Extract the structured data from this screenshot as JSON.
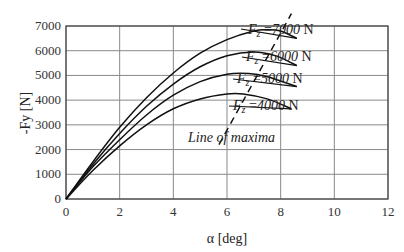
{
  "chart_data": {
    "type": "line",
    "title": "",
    "xlabel": "α [deg]",
    "ylabel": "-Fy [N]",
    "xlim": [
      0,
      12
    ],
    "ylim": [
      0,
      7000
    ],
    "xticks": [
      0,
      2,
      4,
      6,
      8,
      10,
      12
    ],
    "yticks": [
      0,
      1000,
      2000,
      3000,
      4000,
      5000,
      6000,
      7000
    ],
    "grid": true,
    "series": [
      {
        "name": "Fz =7000 N",
        "label_prefix": "F",
        "label_sub": "z",
        "label_value": " =7000 N",
        "x": [
          0,
          1,
          2,
          3,
          4,
          5,
          6,
          7,
          7.5,
          8,
          8.6
        ],
        "y": [
          0,
          1500,
          2900,
          4100,
          5100,
          5900,
          6450,
          6800,
          6850,
          6800,
          6500
        ]
      },
      {
        "name": "Fz =6000 N",
        "label_prefix": "F",
        "label_sub": "z",
        "label_value": " =6000 N",
        "x": [
          0,
          1,
          2,
          3,
          4,
          5,
          6,
          7,
          7.8,
          8.6
        ],
        "y": [
          0,
          1400,
          2650,
          3750,
          4650,
          5350,
          5800,
          5950,
          5800,
          5400
        ]
      },
      {
        "name": "Fz =5000 N",
        "label_prefix": "F",
        "label_sub": "z",
        "label_value": " =5000 N",
        "x": [
          0,
          1,
          2,
          3,
          4,
          5,
          6,
          6.8,
          7.5,
          8.6
        ],
        "y": [
          0,
          1300,
          2400,
          3400,
          4200,
          4750,
          5050,
          5080,
          4950,
          4550
        ]
      },
      {
        "name": "Fz =4000 N",
        "label_prefix": "F",
        "label_sub": "z",
        "label_value": " =4000 N",
        "x": [
          0,
          1,
          2,
          3,
          4,
          5,
          6,
          6.6,
          7.5,
          8.4
        ],
        "y": [
          0,
          1150,
          2150,
          3000,
          3650,
          4050,
          4250,
          4250,
          4050,
          3650
        ]
      }
    ],
    "line_of_maxima": {
      "label": "Line of maxima",
      "x": [
        5.7,
        8.4
      ],
      "y": [
        2200,
        7500
      ],
      "style": "dashed"
    },
    "annotations": [
      "Line of maxima",
      "Fz =7000 N",
      "Fz =6000 N",
      "Fz =5000 N",
      "Fz =4000 N"
    ]
  }
}
